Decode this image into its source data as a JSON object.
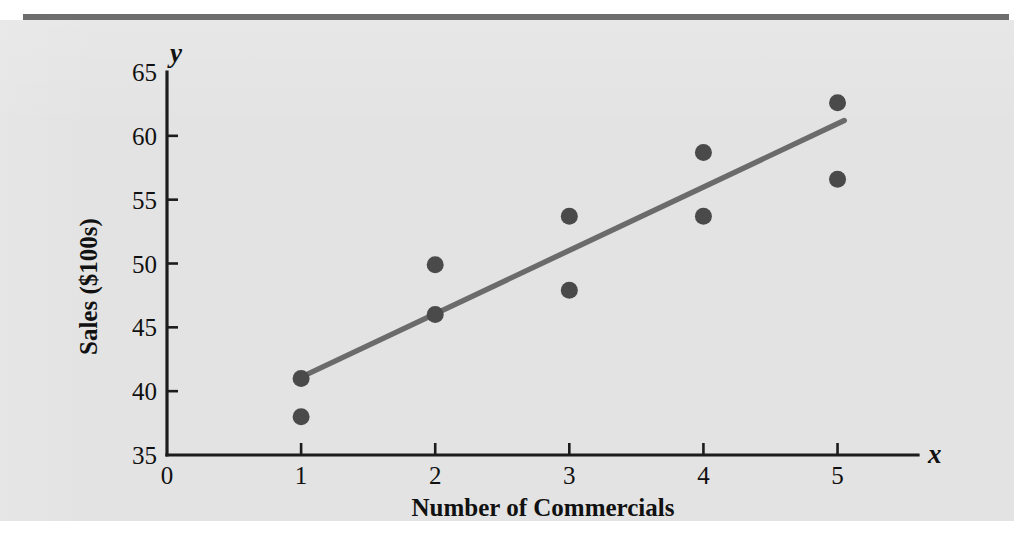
{
  "figure": {
    "background_color": "#e3e3e3",
    "page_color": "#ffffff",
    "rule_color": "#6e6e6e",
    "axis_color": "#1c1c1c",
    "marker_color": "#4a4a4a",
    "trend_color": "#6b6b6b",
    "y_axis_letter": "y",
    "x_axis_letter": "x"
  },
  "chart_data": {
    "type": "scatter",
    "title": "",
    "subtitle": "",
    "xlabel": "Number of Commercials",
    "ylabel": "Sales ($100s)",
    "xlim": [
      0,
      5.6
    ],
    "ylim": [
      35,
      65
    ],
    "xticks": [
      0,
      1,
      2,
      3,
      4,
      5
    ],
    "xtick_labels": [
      "0",
      "1",
      "2",
      "3",
      "4",
      "5"
    ],
    "yticks": [
      35,
      40,
      45,
      50,
      55,
      60,
      65
    ],
    "ytick_labels": [
      "35",
      "40",
      "45",
      "50",
      "55",
      "60",
      "65"
    ],
    "grid": false,
    "legend": null,
    "annotations": [],
    "series": [
      {
        "name": "Sample data",
        "marker": "filled-circle",
        "points": [
          {
            "x": 1,
            "y": 41.0
          },
          {
            "x": 1,
            "y": 38.0
          },
          {
            "x": 2,
            "y": 49.9
          },
          {
            "x": 2,
            "y": 46.0
          },
          {
            "x": 3,
            "y": 53.7
          },
          {
            "x": 3,
            "y": 47.9
          },
          {
            "x": 4,
            "y": 58.7
          },
          {
            "x": 4,
            "y": 53.7
          },
          {
            "x": 5,
            "y": 62.6
          },
          {
            "x": 5,
            "y": 56.6
          }
        ]
      }
    ],
    "trendline": {
      "name": "Estimated regression line",
      "x_start": 1.0,
      "y_start": 41.1,
      "x_end": 5.05,
      "y_end": 61.2,
      "slope": 5.0,
      "intercept": 36.1
    }
  }
}
